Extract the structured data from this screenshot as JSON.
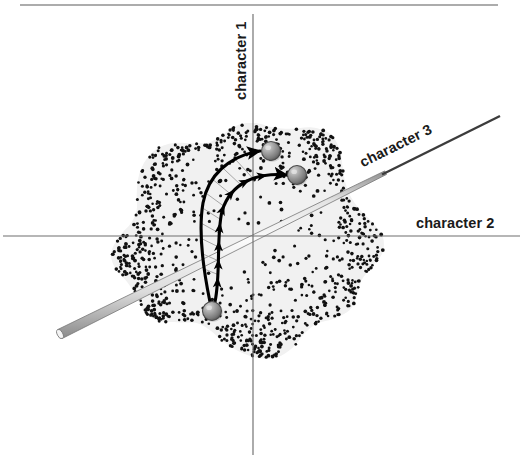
{
  "figure": {
    "title": "",
    "caption": "",
    "background_color": "#ffffff",
    "width": 523,
    "height": 473
  },
  "top_rule": {
    "name": "top-divider",
    "color": "#5a5a5a",
    "x1": 20,
    "x2": 498,
    "y": 5,
    "thickness": 1.2
  },
  "axes": {
    "origin": {
      "x": 253,
      "y": 236
    },
    "vertical": {
      "label": "character 1",
      "color": "#6e6e6e",
      "x": 253,
      "y_top": 14,
      "y_bottom": 455,
      "label_rotation_deg": -90,
      "label_x": 246,
      "label_y": 100
    },
    "horizontal": {
      "label": "character 2",
      "color": "#6e6e6e",
      "y": 236,
      "x_left": 3,
      "x_right": 520,
      "label_x": 416,
      "label_y": 228
    },
    "diagonal": {
      "label": "character 3",
      "color": "#3c3c3c",
      "rod_fill_light": "#fdfdfd",
      "rod_fill_mid": "#e8e8e8",
      "rod_fill_dark": "#9a9a9a",
      "x1": 60,
      "y1": 334,
      "x2": 500,
      "y2": 116,
      "angle_deg": -26.4,
      "label_x": 398,
      "label_y": 150
    }
  },
  "morphospace_blob": {
    "name": "morphospace-region",
    "fill": "#f1f1f1",
    "stipple_color": "#111111",
    "stipple_description": "dense stippling at perimeter fading to sparse in interior",
    "dot_count": 980,
    "dot_radius": 1.6
  },
  "spheres": [
    {
      "id": "sphere-ancestor",
      "role": "ancestral-state",
      "cx": 212,
      "cy": 311,
      "r": 9.5,
      "highlight_color": "#cfcfcf",
      "mid_color": "#8f8f8f",
      "edge_color": "#4a4a4a"
    },
    {
      "id": "sphere-descendant-upper",
      "role": "descendant-state-1",
      "cx": 271,
      "cy": 151,
      "r": 9.5,
      "highlight_color": "#cfcfcf",
      "mid_color": "#8f8f8f",
      "edge_color": "#4a4a4a"
    },
    {
      "id": "sphere-descendant-lower",
      "role": "descendant-state-2",
      "cx": 297,
      "cy": 175,
      "r": 9.5,
      "highlight_color": "#cfcfcf",
      "mid_color": "#8f8f8f",
      "edge_color": "#4a4a4a"
    }
  ],
  "trajectories": [
    {
      "id": "trajectory-outer",
      "description": "outer evolutionary path from ancestor to upper descendant",
      "color": "#000000",
      "stroke_width": 3.1,
      "path": "M 210 302 C 203 268 198 232 203 203 C 208 176 228 156 260 151"
    },
    {
      "id": "trajectory-inner",
      "description": "inner evolutionary path from ancestor to lower descendant, carrying directional arrowheads",
      "color": "#000000",
      "stroke_width": 3.1,
      "path": "M 215 302 C 221 272 216 238 222 211 C 231 182 258 172 287 175"
    }
  ],
  "hatch_lines": {
    "name": "deformation-hatching",
    "color": "#9d9d9d",
    "stroke_width": 0.9,
    "count": 9,
    "description": "thin gray tie lines linking the outer and inner trajectories"
  },
  "arrowheads": {
    "name": "direction-arrowheads",
    "color": "#000000",
    "count": 8,
    "description": "solid black arrowheads along the inner trajectory and at both descendant spheres"
  }
}
